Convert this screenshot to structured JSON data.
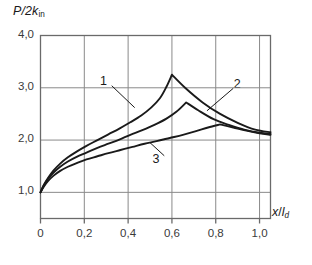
{
  "figure": {
    "axis_labels": {
      "y": "P/2k_in",
      "y_parts": {
        "main": "P/2k",
        "sub": "in"
      },
      "x": "x/l_d",
      "x_parts": {
        "num": "x",
        "slash": "/",
        "den": "l",
        "sub": "d"
      }
    },
    "y_ticks": [
      "1,0",
      "2,0",
      "3,0",
      "4,0"
    ],
    "x_ticks": [
      "0",
      "0,2",
      "0,4",
      "0,6",
      "0,8",
      "1,0"
    ],
    "curve_labels": [
      "1",
      "2",
      "3"
    ]
  },
  "chart_data": {
    "type": "line",
    "title": "",
    "xlabel": "x/l_d",
    "ylabel": "P/2k_in",
    "xlim": [
      0,
      1.05
    ],
    "ylim": [
      0.5,
      4.0
    ],
    "xticks": [
      0,
      0.2,
      0.4,
      0.6,
      0.8,
      1.0
    ],
    "xticklabels": [
      "0",
      "0,2",
      "0,4",
      "0,6",
      "0,8",
      "1,0"
    ],
    "yticks": [
      1.0,
      2.0,
      3.0,
      4.0
    ],
    "yticklabels": [
      "1,0",
      "2,0",
      "3,0",
      "4,0"
    ],
    "grid": true,
    "legend": "inline-annotations",
    "decimal_separator": ",",
    "series": [
      {
        "name": "1",
        "label_position": {
          "x": 0.29,
          "y": 3.12
        },
        "peak": {
          "x": 0.6,
          "y": 3.25
        },
        "points": [
          [
            0.0,
            1.0
          ],
          [
            0.015,
            1.14
          ],
          [
            0.035,
            1.28
          ],
          [
            0.06,
            1.42
          ],
          [
            0.09,
            1.55
          ],
          [
            0.125,
            1.67
          ],
          [
            0.165,
            1.78
          ],
          [
            0.21,
            1.89
          ],
          [
            0.26,
            2.0
          ],
          [
            0.31,
            2.11
          ],
          [
            0.36,
            2.22
          ],
          [
            0.41,
            2.34
          ],
          [
            0.46,
            2.47
          ],
          [
            0.505,
            2.62
          ],
          [
            0.545,
            2.8
          ],
          [
            0.575,
            3.02
          ],
          [
            0.6,
            3.25
          ],
          [
            0.66,
            3.0
          ],
          [
            0.74,
            2.72
          ],
          [
            0.82,
            2.5
          ],
          [
            0.9,
            2.33
          ],
          [
            0.98,
            2.2
          ],
          [
            1.05,
            2.15
          ]
        ]
      },
      {
        "name": "2",
        "label_position": {
          "x": 0.9,
          "y": 3.06
        },
        "peak": {
          "x": 0.665,
          "y": 2.72
        },
        "points": [
          [
            0.0,
            1.0
          ],
          [
            0.015,
            1.13
          ],
          [
            0.035,
            1.26
          ],
          [
            0.06,
            1.38
          ],
          [
            0.09,
            1.49
          ],
          [
            0.125,
            1.59
          ],
          [
            0.165,
            1.68
          ],
          [
            0.21,
            1.76
          ],
          [
            0.26,
            1.85
          ],
          [
            0.31,
            1.93
          ],
          [
            0.36,
            2.01
          ],
          [
            0.41,
            2.1
          ],
          [
            0.465,
            2.19
          ],
          [
            0.52,
            2.29
          ],
          [
            0.575,
            2.41
          ],
          [
            0.62,
            2.54
          ],
          [
            0.665,
            2.72
          ],
          [
            0.72,
            2.57
          ],
          [
            0.79,
            2.4
          ],
          [
            0.86,
            2.29
          ],
          [
            0.93,
            2.2
          ],
          [
            1.0,
            2.14
          ],
          [
            1.05,
            2.12
          ]
        ]
      },
      {
        "name": "3",
        "label_position": {
          "x": 0.53,
          "y": 1.62
        },
        "peak": {
          "x": 0.82,
          "y": 2.3
        },
        "points": [
          [
            0.0,
            1.0
          ],
          [
            0.015,
            1.11
          ],
          [
            0.035,
            1.22
          ],
          [
            0.06,
            1.32
          ],
          [
            0.09,
            1.41
          ],
          [
            0.125,
            1.49
          ],
          [
            0.165,
            1.56
          ],
          [
            0.21,
            1.63
          ],
          [
            0.26,
            1.69
          ],
          [
            0.31,
            1.75
          ],
          [
            0.365,
            1.81
          ],
          [
            0.42,
            1.87
          ],
          [
            0.475,
            1.93
          ],
          [
            0.53,
            1.98
          ],
          [
            0.59,
            2.04
          ],
          [
            0.65,
            2.1
          ],
          [
            0.71,
            2.17
          ],
          [
            0.765,
            2.24
          ],
          [
            0.82,
            2.3
          ],
          [
            0.88,
            2.24
          ],
          [
            0.94,
            2.18
          ],
          [
            1.0,
            2.13
          ],
          [
            1.05,
            2.1
          ]
        ]
      }
    ],
    "leader_lines": [
      {
        "series": "1",
        "from": [
          0.325,
          3.04
        ],
        "to": [
          0.43,
          2.62
        ]
      },
      {
        "series": "2",
        "from": [
          0.88,
          2.99
        ],
        "to": [
          0.76,
          2.56
        ]
      },
      {
        "series": "3",
        "from": [
          0.565,
          1.7
        ],
        "to": [
          0.5,
          1.95
        ]
      }
    ]
  }
}
